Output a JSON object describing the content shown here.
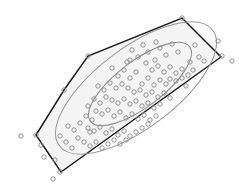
{
  "figure": {
    "title": "",
    "background_color": "#ffffff",
    "width": 239,
    "height": 192
  },
  "colors": {
    "hull_stroke": "#1a1a1a",
    "hull_fill": "#f2f2f2",
    "ellipse_stroke": "#9a9a9a",
    "point_stroke": "#8c8c8c",
    "background": "#ffffff"
  },
  "chart_data": {
    "type": "scatter",
    "title": "",
    "xlabel": "",
    "ylabel": "",
    "xlim": [
      0,
      239
    ],
    "ylim": [
      0,
      192
    ],
    "grid": false,
    "legend": null,
    "axes_visible": false,
    "tick_labels": [],
    "point_marker": "open-circle",
    "point_radius": 2.2,
    "series": [
      {
        "name": "observations",
        "n": 112,
        "points": [
          [
            182,
            18
          ],
          [
            218,
            41
          ],
          [
            222,
            56
          ],
          [
            232,
            61
          ],
          [
            88,
            56
          ],
          [
            64,
            90
          ],
          [
            36,
            135
          ],
          [
            60,
            172
          ],
          [
            21,
            136
          ],
          [
            53,
            179
          ],
          [
            44,
            157
          ],
          [
            41,
            145
          ],
          [
            195,
            45
          ],
          [
            199,
            57
          ],
          [
            204,
            61
          ],
          [
            190,
            62
          ],
          [
            178,
            52
          ],
          [
            172,
            44
          ],
          [
            166,
            55
          ],
          [
            160,
            48
          ],
          [
            155,
            60
          ],
          [
            148,
            52
          ],
          [
            143,
            45
          ],
          [
            138,
            57
          ],
          [
            132,
            50
          ],
          [
            127,
            62
          ],
          [
            146,
            63
          ],
          [
            152,
            70
          ],
          [
            158,
            66
          ],
          [
            164,
            72
          ],
          [
            170,
            67
          ],
          [
            176,
            73
          ],
          [
            182,
            69
          ],
          [
            188,
            75
          ],
          [
            170,
            79
          ],
          [
            176,
            81
          ],
          [
            182,
            78
          ],
          [
            166,
            84
          ],
          [
            160,
            80
          ],
          [
            154,
            85
          ],
          [
            148,
            78
          ],
          [
            142,
            84
          ],
          [
            136,
            72
          ],
          [
            130,
            78
          ],
          [
            124,
            70
          ],
          [
            118,
            76
          ],
          [
            112,
            68
          ],
          [
            122,
            84
          ],
          [
            128,
            88
          ],
          [
            134,
            92
          ],
          [
            140,
            90
          ],
          [
            146,
            95
          ],
          [
            152,
            92
          ],
          [
            158,
            97
          ],
          [
            164,
            93
          ],
          [
            170,
            98
          ],
          [
            116,
            88
          ],
          [
            110,
            83
          ],
          [
            104,
            90
          ],
          [
            98,
            86
          ],
          [
            106,
            97
          ],
          [
            112,
            100
          ],
          [
            118,
            103
          ],
          [
            124,
            99
          ],
          [
            130,
            104
          ],
          [
            136,
            101
          ],
          [
            142,
            106
          ],
          [
            148,
            103
          ],
          [
            154,
            108
          ],
          [
            160,
            104
          ],
          [
            100,
            103
          ],
          [
            94,
            99
          ],
          [
            88,
            106
          ],
          [
            96,
            111
          ],
          [
            102,
            114
          ],
          [
            108,
            110
          ],
          [
            114,
            116
          ],
          [
            120,
            112
          ],
          [
            126,
            118
          ],
          [
            132,
            114
          ],
          [
            138,
            119
          ],
          [
            144,
            115
          ],
          [
            150,
            120
          ],
          [
            156,
            116
          ],
          [
            92,
            120
          ],
          [
            86,
            116
          ],
          [
            80,
            123
          ],
          [
            88,
            128
          ],
          [
            94,
            131
          ],
          [
            100,
            127
          ],
          [
            106,
            133
          ],
          [
            112,
            129
          ],
          [
            118,
            135
          ],
          [
            124,
            131
          ],
          [
            130,
            136
          ],
          [
            136,
            132
          ],
          [
            142,
            128
          ],
          [
            148,
            124
          ],
          [
            74,
            130
          ],
          [
            68,
            126
          ],
          [
            78,
            138
          ],
          [
            84,
            142
          ],
          [
            90,
            146
          ],
          [
            96,
            142
          ],
          [
            72,
            148
          ],
          [
            66,
            142
          ],
          [
            60,
            136
          ],
          [
            102,
            148
          ],
          [
            108,
            144
          ],
          [
            114,
            140
          ],
          [
            120,
            144
          ],
          [
            126,
            140
          ],
          [
            156,
            42
          ],
          [
            193,
            70
          ],
          [
            186,
            86
          ],
          [
            130,
            60
          ],
          [
            90,
            132
          ],
          [
            55,
            160
          ]
        ]
      }
    ],
    "convex_hull": {
      "name": "convex hull of observations",
      "closed": true,
      "vertices": [
        [
          182,
          18
        ],
        [
          221,
          57
        ],
        [
          61,
          172
        ],
        [
          36,
          135
        ],
        [
          64,
          90
        ],
        [
          88,
          56
        ]
      ]
    },
    "contours": [
      {
        "name": "inner confidence ellipse",
        "level": "inner",
        "center": [
          140,
          84
        ],
        "rx": 62,
        "ry": 23,
        "rotation_deg": -37
      },
      {
        "name": "outer confidence ellipse",
        "level": "outer",
        "center": [
          136,
          88
        ],
        "rx": 96,
        "ry": 40,
        "rotation_deg": -37
      }
    ],
    "annotations": []
  }
}
